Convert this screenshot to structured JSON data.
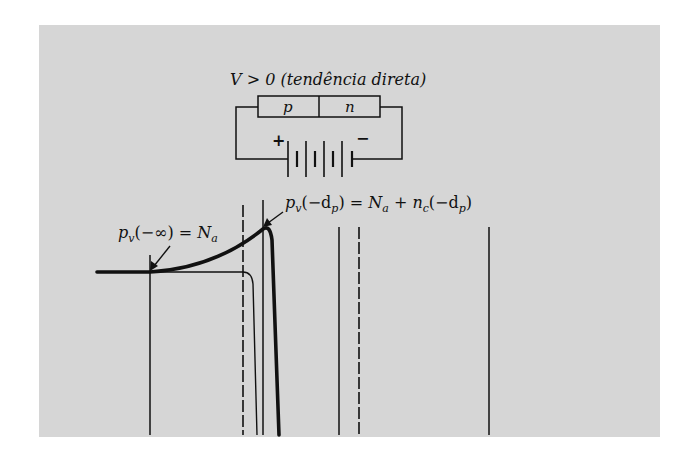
{
  "figure": {
    "background_color": "#d6d6d6",
    "ink_color": "#111111"
  },
  "circuit": {
    "title": "V > 0 (tendência direta)",
    "junction": {
      "p_label": "p",
      "n_label": "n"
    },
    "battery": {
      "plus_label": "+",
      "minus_label": "−"
    }
  },
  "annotations": {
    "left": {
      "base": "p",
      "sub": "v",
      "arg": "(−∞) = ",
      "rhs_base": "N",
      "rhs_sub": "a"
    },
    "right": {
      "base": "p",
      "sub": "v",
      "arg_open": "(−d",
      "arg_sub": "p",
      "arg_close": ") = ",
      "t1": "N",
      "t1_sub": "a",
      "plus": " + ",
      "t2": "n",
      "t2_sub": "c",
      "t2_open": "(−d",
      "t2_arg_sub": "p",
      "t2_close": ")"
    }
  },
  "plot": {
    "curves": [
      {
        "name": "hole-density-thick",
        "style": "thick-solid"
      },
      {
        "name": "secondary-thin",
        "style": "thin-solid"
      }
    ],
    "vertical_lines": [
      {
        "x": 150,
        "style": "solid"
      },
      {
        "x": 243,
        "style": "dashed"
      },
      {
        "x": 263,
        "style": "solid"
      },
      {
        "x": 339,
        "style": "solid"
      },
      {
        "x": 359,
        "style": "dashed"
      },
      {
        "x": 489,
        "style": "solid"
      }
    ]
  }
}
